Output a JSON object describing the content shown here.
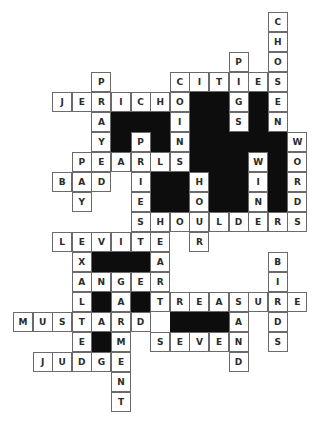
{
  "puzzle": {
    "type": "crossword",
    "cell_w": 19.6,
    "cell_h": 20,
    "origin_x": 13,
    "origin_y": 12,
    "colors": {
      "black": "#0d0d0d",
      "border": "#6a6a6a",
      "text": "#2a2a2a"
    },
    "words": [
      {
        "word": "CHOSEN",
        "row": 0,
        "col": 13,
        "dir": "down"
      },
      {
        "word": "PIGS",
        "row": 2,
        "col": 11,
        "dir": "down"
      },
      {
        "word": "CITIES",
        "row": 3,
        "col": 8,
        "dir": "across"
      },
      {
        "word": "PRAYED",
        "row": 3,
        "col": 4,
        "dir": "down"
      },
      {
        "word": "JERICHO",
        "row": 4,
        "col": 2,
        "dir": "across"
      },
      {
        "word": "COINS",
        "row": 3,
        "col": 8,
        "dir": "down"
      },
      {
        "word": "PRIEST",
        "row": 6,
        "col": 6,
        "dir": "down"
      },
      {
        "word": "WORDS",
        "row": 6,
        "col": 14,
        "dir": "down"
      },
      {
        "word": "PEARLS",
        "row": 7,
        "col": 3,
        "dir": "across"
      },
      {
        "word": "PAY",
        "row": 7,
        "col": 3,
        "dir": "down"
      },
      {
        "word": "WIND",
        "row": 7,
        "col": 12,
        "dir": "down"
      },
      {
        "word": "BAD",
        "row": 8,
        "col": 2,
        "dir": "across"
      },
      {
        "word": "HOUR",
        "row": 8,
        "col": 9,
        "dir": "down"
      },
      {
        "word": "SHOULDERS",
        "row": 10,
        "col": 6,
        "dir": "across"
      },
      {
        "word": "LEVITE",
        "row": 11,
        "col": 2,
        "dir": "across"
      },
      {
        "word": "EXALTED",
        "row": 11,
        "col": 3,
        "dir": "down"
      },
      {
        "word": "EART",
        "row": 11,
        "col": 7,
        "dir": "down"
      },
      {
        "word": "BIRDS",
        "row": 12,
        "col": 13,
        "dir": "down"
      },
      {
        "word": "ANGER",
        "row": 13,
        "col": 3,
        "dir": "across"
      },
      {
        "word": "GARMENT",
        "row": 13,
        "col": 5,
        "dir": "down"
      },
      {
        "word": "TREASURE",
        "row": 14,
        "col": 7,
        "dir": "across"
      },
      {
        "word": "SAND",
        "row": 14,
        "col": 11,
        "dir": "down"
      },
      {
        "word": "MUSTARD",
        "row": 15,
        "col": 0,
        "dir": "across"
      },
      {
        "word": "SEVEN",
        "row": 16,
        "col": 7,
        "dir": "across"
      },
      {
        "word": "JUDGE",
        "row": 17,
        "col": 1,
        "dir": "across"
      }
    ],
    "black_cells": [
      [
        4,
        9
      ],
      [
        4,
        10
      ],
      [
        4,
        12
      ],
      [
        5,
        5
      ],
      [
        5,
        6
      ],
      [
        5,
        7
      ],
      [
        5,
        9
      ],
      [
        5,
        10
      ],
      [
        5,
        12
      ],
      [
        6,
        5
      ],
      [
        6,
        7
      ],
      [
        6,
        9
      ],
      [
        6,
        10
      ],
      [
        6,
        11
      ],
      [
        6,
        12
      ],
      [
        6,
        13
      ],
      [
        7,
        9
      ],
      [
        7,
        10
      ],
      [
        7,
        11
      ],
      [
        7,
        13
      ],
      [
        8,
        7
      ],
      [
        8,
        8
      ],
      [
        8,
        10
      ],
      [
        8,
        11
      ],
      [
        8,
        13
      ],
      [
        9,
        7
      ],
      [
        9,
        8
      ],
      [
        9,
        10
      ],
      [
        9,
        11
      ],
      [
        9,
        13
      ],
      [
        12,
        4
      ],
      [
        12,
        5
      ],
      [
        12,
        6
      ],
      [
        14,
        4
      ],
      [
        14,
        6
      ],
      [
        15,
        8
      ],
      [
        15,
        9
      ],
      [
        15,
        10
      ],
      [
        15,
        11
      ],
      [
        16,
        4
      ]
    ]
  }
}
